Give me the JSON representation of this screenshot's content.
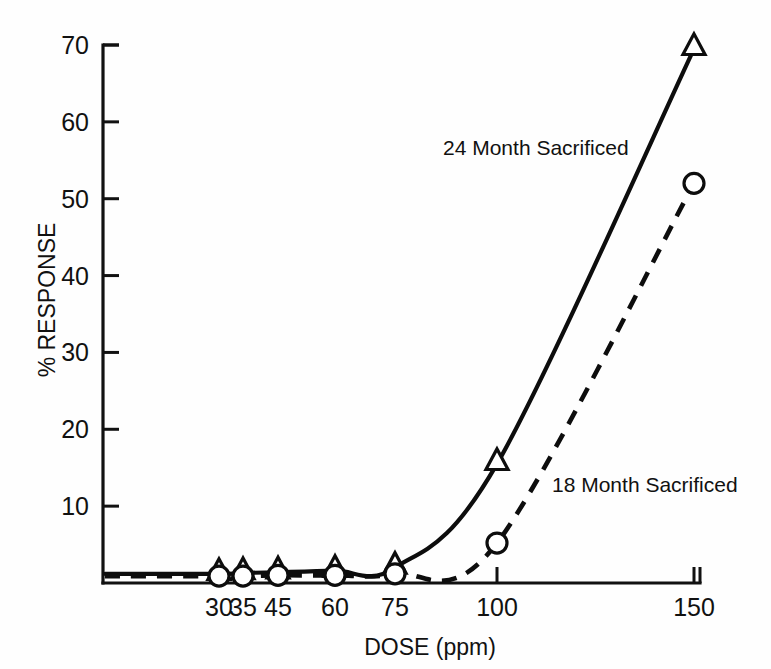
{
  "chart_data": {
    "type": "line",
    "title": "",
    "xlabel": "DOSE (ppm)",
    "ylabel": "% RESPONSE",
    "x_tick_labels": [
      "30",
      "35",
      "45",
      "60",
      "75",
      "100",
      "150"
    ],
    "x_tick_values": [
      30,
      35,
      45,
      60,
      75,
      100,
      150
    ],
    "y_tick_labels": [
      "10",
      "20",
      "30",
      "40",
      "50",
      "60",
      "70"
    ],
    "y_tick_values": [
      10,
      20,
      30,
      40,
      50,
      60,
      70
    ],
    "ylim": [
      0,
      73
    ],
    "xlim": [
      20,
      158
    ],
    "grid": false,
    "legend_position": "inline-annotations",
    "series": [
      {
        "name": "24 Month Sacrificed",
        "marker": "triangle",
        "linestyle": "solid",
        "x": [
          30,
          35,
          45,
          60,
          75,
          100,
          150
        ],
        "values": [
          1.2,
          1.3,
          1.4,
          1.6,
          2.0,
          15.5,
          69.5
        ]
      },
      {
        "name": "18 Month Sacrificed",
        "marker": "circle",
        "linestyle": "dashed",
        "x": [
          30,
          35,
          45,
          60,
          75,
          100,
          150
        ],
        "values": [
          0.9,
          0.9,
          1.0,
          1.0,
          1.2,
          5.2,
          52.0
        ]
      }
    ],
    "annotations": [
      {
        "text": "24 Month Sacrificed",
        "x": 92,
        "y": 57
      },
      {
        "text": "18 Month Sacrificed",
        "x": 118,
        "y": 13
      }
    ],
    "colors": {
      "line": "#0d0d0d",
      "axis": "#111111",
      "marker_fill": "#ffffff",
      "background": "#fefefe"
    }
  }
}
